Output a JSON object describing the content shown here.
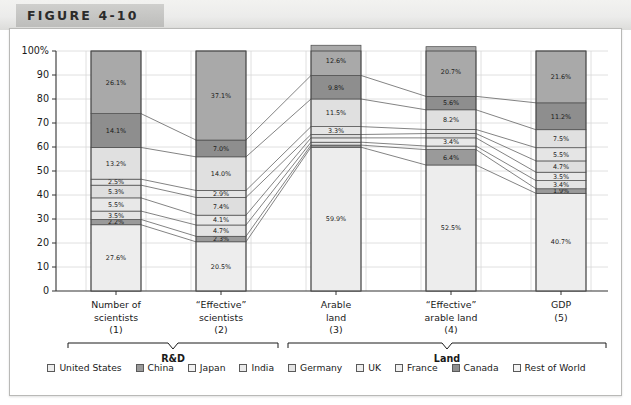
{
  "figure": {
    "title": "FIGURE 4-10"
  },
  "chart_data": {
    "type": "bar",
    "subtype": "stacked-100-percent-with-ribbons",
    "title": "FIGURE 4-10",
    "xlabel": "",
    "ylabel": "",
    "ylim": [
      0,
      100
    ],
    "grid": true,
    "legend_position": "bottom",
    "y_ticks": [
      "0",
      "10",
      "20",
      "30",
      "40",
      "50",
      "60",
      "70",
      "80",
      "90",
      "100%"
    ],
    "y_tick_values": [
      0,
      10,
      20,
      30,
      40,
      50,
      60,
      70,
      80,
      90,
      100
    ],
    "categories": [
      {
        "line1": "Number of",
        "line2": "scientists",
        "line3": "(1)"
      },
      {
        "line1": "“Effective”",
        "line2": "scientists",
        "line3": "(2)"
      },
      {
        "line1": "Arable",
        "line2": "land",
        "line3": "(3)"
      },
      {
        "line1": "“Effective”",
        "line2": "arable land",
        "line3": "(4)"
      },
      {
        "line1": "GDP",
        "line2": "",
        "line3": "(5)"
      }
    ],
    "groups": [
      {
        "label": "R&D",
        "categories": [
          0,
          1
        ]
      },
      {
        "label": "Land",
        "categories": [
          2,
          3,
          4
        ]
      }
    ],
    "series": [
      {
        "name": "United States",
        "color": "#ededed",
        "values": [
          27.6,
          20.5,
          59.9,
          52.5,
          40.7
        ]
      },
      {
        "name": "China",
        "color": "#9a9a9a",
        "values": [
          2.2,
          2.3,
          0.9,
          6.4,
          1.9
        ]
      },
      {
        "name": "Japan",
        "color": "#e3e3e3",
        "values": [
          3.5,
          4.7,
          1.2,
          1.5,
          3.4
        ]
      },
      {
        "name": "India",
        "color": "#e8e8e8",
        "values": [
          5.5,
          4.1,
          1.8,
          3.4,
          3.5
        ]
      },
      {
        "name": "Germany",
        "color": "#dedede",
        "values": [
          5.3,
          7.4,
          1.4,
          1.8,
          4.7
        ]
      },
      {
        "name": "UK",
        "color": "#e5e5e5",
        "values": [
          2.5,
          2.9,
          3.3,
          1.7,
          5.5
        ]
      },
      {
        "name": "France",
        "color": "#e0e0e0",
        "values": [
          13.2,
          14.0,
          11.5,
          8.2,
          7.5
        ]
      },
      {
        "name": "Canada",
        "color": "#8e8e8e",
        "values": [
          14.1,
          7.0,
          9.8,
          5.6,
          11.2
        ]
      },
      {
        "name": "Rest of World",
        "color": "#a9a9a9",
        "values": [
          26.1,
          37.1,
          12.6,
          20.7,
          21.6
        ]
      }
    ],
    "segment_labels": {
      "col1": [
        "27.6%",
        "2.2%",
        "3.5%",
        "5.5%",
        "5.3%",
        "2.5%",
        "13.2%",
        "14.1%",
        "26.1%"
      ],
      "col2": [
        "20.5%",
        "2.3%",
        "4.7%",
        "4.1%",
        "7.4%",
        "2.9%",
        "14.0%",
        "7.0%",
        "37.1%"
      ],
      "col3": [
        "59.9%",
        "",
        "",
        "",
        "",
        "3.3%",
        "11.5%",
        "9.8%",
        "12.6%"
      ],
      "col4": [
        "52.5%",
        "6.4%",
        "",
        "3.4%",
        "",
        "",
        "8.2%",
        "5.6%",
        "20.7%"
      ],
      "col5": [
        "40.7%",
        "1.9%",
        "3.4%",
        "3.5%",
        "4.7%",
        "5.5%",
        "7.5%",
        "11.2%",
        "21.6%"
      ]
    }
  },
  "legend": {
    "items": [
      {
        "label": "United States",
        "color": "#ededed"
      },
      {
        "label": "China",
        "color": "#9a9a9a"
      },
      {
        "label": "Japan",
        "color": "#f2f2f2"
      },
      {
        "label": "India",
        "color": "#eaeaea"
      },
      {
        "label": "Germany",
        "color": "#e4e4e4"
      },
      {
        "label": "UK",
        "color": "#eeeeee"
      },
      {
        "label": "France",
        "color": "#f0f0f0"
      },
      {
        "label": "Canada",
        "color": "#8e8e8e"
      },
      {
        "label": "Rest of World",
        "color": "#f4f4f4"
      }
    ]
  },
  "colors": {
    "frame_border": "#b9b9b7",
    "grid": "#d8d8d8",
    "axis": "#333333",
    "bar_outline": "#4a4a4a",
    "ribbon": "#5a5a5a"
  }
}
